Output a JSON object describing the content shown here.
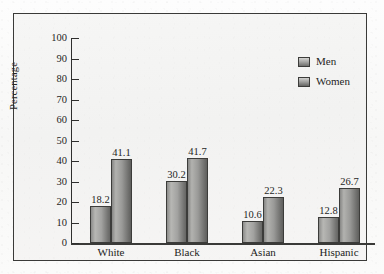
{
  "figure": {
    "background_color": "#f4f4f3",
    "frame_color": "#3a3a38",
    "axis_color": "#2f2f2e"
  },
  "legend": {
    "position": "top-right",
    "entries": [
      {
        "label": "Men",
        "color": "#a2a2a0",
        "swatch": "gradient-gray-light"
      },
      {
        "label": "Women",
        "color": "#7a7a78",
        "swatch": "gradient-gray-dark"
      }
    ]
  },
  "axes": {
    "y_title": "Percentage",
    "y_ticks": [
      "100",
      "90",
      "80",
      "70",
      "60",
      "50",
      "40",
      "30",
      "20",
      "10",
      "0"
    ],
    "x_labels": [
      "White",
      "Black",
      "Asian",
      "Hispanic"
    ]
  },
  "chart_data": {
    "type": "bar",
    "title": "",
    "xlabel": "",
    "ylabel": "Percentage",
    "ylim": [
      0,
      100
    ],
    "ytick_step": 10,
    "grid": false,
    "legend_position": "top-right",
    "categories": [
      "White",
      "Black",
      "Asian",
      "Hispanic"
    ],
    "series": [
      {
        "name": "Men",
        "values": [
          18.2,
          30.2,
          10.6,
          12.8
        ]
      },
      {
        "name": "Women",
        "values": [
          41.1,
          41.7,
          22.3,
          26.7
        ]
      }
    ],
    "data_labels": [
      "18.2",
      "41.1",
      "30.2",
      "41.7",
      "10.6",
      "22.3",
      "12.8",
      "26.7"
    ]
  }
}
